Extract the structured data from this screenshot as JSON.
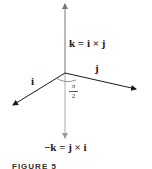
{
  "figure": {
    "caption": "FIGURE 5",
    "labels": {
      "k_eq": "k = i × j",
      "neg_k_eq": "−k = j × i",
      "i": "i",
      "j": "j",
      "angle_num": "π",
      "angle_den": "2"
    },
    "vectors": [
      {
        "name": "k",
        "direction": "up",
        "color": "#555555"
      },
      {
        "name": "-k",
        "direction": "down",
        "color": "#999999"
      },
      {
        "name": "i",
        "direction": "down-left",
        "color": "#1a1a1a"
      },
      {
        "name": "j",
        "direction": "right",
        "color": "#1a1a1a"
      }
    ],
    "angle": "π/2"
  }
}
